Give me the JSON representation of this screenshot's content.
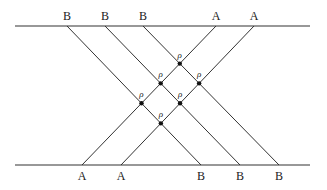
{
  "diagram": {
    "top_line": {
      "x1": 15,
      "x2": 310,
      "y": 26
    },
    "bottom_line": {
      "x1": 15,
      "x2": 310,
      "y": 165
    },
    "top_labels": [
      {
        "text": "B",
        "x": 67
      },
      {
        "text": "B",
        "x": 105
      },
      {
        "text": "B",
        "x": 143
      },
      {
        "text": "A",
        "x": 216
      },
      {
        "text": "A",
        "x": 254
      }
    ],
    "bottom_labels": [
      {
        "text": "A",
        "x": 82
      },
      {
        "text": "A",
        "x": 121
      },
      {
        "text": "B",
        "x": 201
      },
      {
        "text": "B",
        "x": 240
      },
      {
        "text": "B",
        "x": 279
      }
    ],
    "b_lines": [
      [
        67,
        201
      ],
      [
        105,
        240
      ],
      [
        143,
        279
      ]
    ],
    "a_lines": [
      [
        216,
        82
      ],
      [
        254,
        121
      ]
    ],
    "node_label": "ρ"
  }
}
